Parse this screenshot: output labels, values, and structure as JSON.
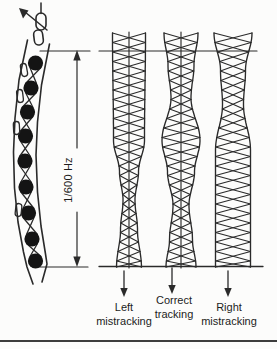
{
  "colors": {
    "ink": "#2a2a2a",
    "paper": "#fcfcfb",
    "roller_fill": "#141414",
    "rule": "#3d3d3d"
  },
  "dimension": {
    "label": "1/600 Hz"
  },
  "tracks": [
    {
      "id": "left-mistracking",
      "line1": "Left",
      "line2": "mistracking"
    },
    {
      "id": "correct-tracking",
      "line1": "Correct",
      "line2": "tracking"
    },
    {
      "id": "right-mistracking",
      "line1": "Right",
      "line2": "mistracking"
    }
  ],
  "diagram": {
    "type": "diagram",
    "chain": {
      "roller_count": 9
    },
    "columns": [
      {
        "id": "left-mistracking",
        "centerX": 129,
        "centerLine": true,
        "envelope": [
          [
            33,
            16.5
          ],
          [
            140,
            15.5
          ],
          [
            172,
            9.5
          ],
          [
            200,
            6
          ],
          [
            230,
            8.5
          ],
          [
            267,
            12.5
          ]
        ]
      },
      {
        "id": "correct-tracking",
        "centerX": 181,
        "centerLine": true,
        "envelope": [
          [
            33,
            17
          ],
          [
            65,
            13
          ],
          [
            98,
            10
          ],
          [
            140,
            19
          ],
          [
            172,
            13.5
          ],
          [
            205,
            8
          ],
          [
            240,
            11.5
          ],
          [
            267,
            15
          ]
        ]
      },
      {
        "id": "right-mistracking",
        "centerX": 233,
        "centerLine": false,
        "envelope": [
          [
            33,
            19
          ],
          [
            70,
            12.5
          ],
          [
            105,
            10.5
          ],
          [
            150,
            17.5
          ],
          [
            267,
            17.5
          ]
        ]
      }
    ],
    "tracking_arrows": [
      {
        "x": 124,
        "y1": 271,
        "y2": 297
      },
      {
        "x": 172,
        "y1": 268,
        "y2": 294
      },
      {
        "x": 228,
        "y1": 271,
        "y2": 297
      }
    ]
  }
}
